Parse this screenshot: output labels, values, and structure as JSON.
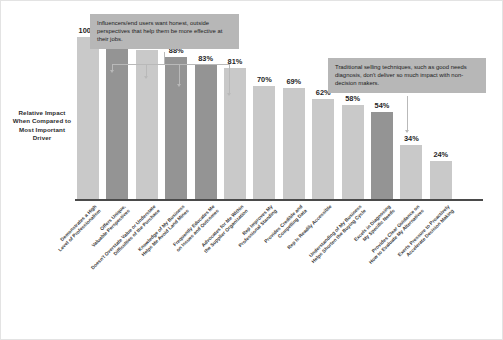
{
  "chart": {
    "ylabel": "Relative Impact When Compared to Most Important Driver",
    "colors": {
      "bar_light": "#c9c9c9",
      "bar_dark": "#949494",
      "callout_bg": "#b7b7b7",
      "axis": "#4a4a4a"
    }
  },
  "callouts": [
    {
      "id": "callout-influencers",
      "text": "Influencers/end users want honest, outside perspectives that help them be more effective at their jobs."
    },
    {
      "id": "callout-traditional",
      "text": "Traditional selling techniques, such as good needs diagnosis, don't deliver so much impact with non-decision makers."
    }
  ],
  "chart_data": {
    "type": "bar",
    "title": "",
    "xlabel": "",
    "ylabel": "Relative Impact When Compared to Most Important Driver",
    "ylim": [
      0,
      100
    ],
    "grid": false,
    "legend": "none",
    "categories": [
      "Demonstrates a High\nLevel of Professionalism",
      "Offers Unique,\nValuable Perspectives",
      "Doesn't Overstate Value or Understate\nDifficulties of the Purchase",
      "Knowledge of My Business\nHelps Me Avoid Land Mines",
      "Frequently Educates Me\non Issues and Outcomes",
      "Advocates for Me Within\nthe Supplier Organization",
      "Rep Improves My\nProfessional Standing",
      "Provides Credible and\nCompelling Data",
      "Rep Is Readily Accessible",
      "Understanding of My Business\nHelps Shorten the Buying Cycle",
      "Excels in Diagnosing\nMy Specific Needs",
      "Provides Clear Guidance on\nHow to Evaluate My Alternatives",
      "Exerts Pressure to Proactively\nAccelerate Decision Making"
    ],
    "values": [
      100,
      97,
      92,
      88,
      83,
      81,
      70,
      69,
      62,
      58,
      54,
      34,
      24
    ],
    "labels": [
      "100%",
      "97%",
      "92%",
      "88%",
      "83%",
      "81%",
      "70%",
      "69%",
      "62%",
      "58%",
      "54%",
      "34%",
      "24%"
    ],
    "shades": [
      "light",
      "dark",
      "light",
      "dark",
      "dark",
      "light",
      "light",
      "light",
      "light",
      "light",
      "dark",
      "light",
      "light"
    ]
  }
}
